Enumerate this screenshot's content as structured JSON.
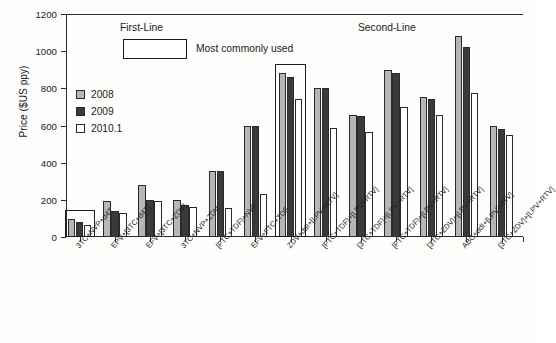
{
  "chart_data": {
    "type": "bar",
    "title": "",
    "xlabel": "",
    "ylabel": "Price ($US ppy)",
    "ylim": [
      0,
      1200
    ],
    "yticks": [
      0,
      200,
      400,
      600,
      800,
      1000,
      1200
    ],
    "grid": false,
    "legend_position": "upper-left-inside",
    "categories": [
      "3TC+NVP+d4T",
      "EPV+[3TC+d4T]",
      "EFV+[3TC+ZDV]",
      "3TC+NVP+ZDV",
      "[FTC+TDF]+NVP",
      "EFV+FTC+TDF",
      "ZDV+ddI+[LPV+RTV]",
      "[FTC+TDF]+[LPV+RTV]",
      "[3TC+TDF]+[LPV+RTV]",
      "[FTC+TDF]+[LPV+RTV]",
      "[3TC+ZDV]+[LPV+RTV]",
      "ABC+ddI+[LPV+RTV]",
      "[3TC+ZDV]+[LPV+RTV]"
    ],
    "series": [
      {
        "name": "2008",
        "color": "#b6b6b6",
        "values": [
          95,
          195,
          280,
          200,
          355,
          600,
          880,
          800,
          655,
          900,
          755,
          1080,
          600
        ]
      },
      {
        "name": "2009",
        "color": "#3a3a3a",
        "values": [
          80,
          140,
          200,
          170,
          355,
          600,
          860,
          800,
          650,
          880,
          740,
          1025,
          580
        ]
      },
      {
        "name": "2010.1",
        "color": "#ffffff",
        "values": [
          65,
          130,
          195,
          160,
          155,
          230,
          740,
          585,
          565,
          700,
          655,
          775,
          550
        ]
      }
    ],
    "annotations": [
      {
        "text": "First-Line",
        "name": "first-line-section-label"
      },
      {
        "text": "Second-Line",
        "name": "second-line-section-label"
      },
      {
        "text": "Most commonly used",
        "name": "most-commonly-used-legend-text"
      }
    ],
    "highlighted_groups": [
      0,
      6
    ],
    "highlight_note": "Most commonly used"
  },
  "axes": {
    "y_label": "Price ($US ppy)",
    "y_ticks": [
      "0",
      "200",
      "400",
      "600",
      "800",
      "1000",
      "1200"
    ]
  },
  "legend": {
    "items": [
      {
        "label": "2008",
        "color": "#b6b6b6"
      },
      {
        "label": "2009",
        "color": "#3a3a3a"
      },
      {
        "label": "2010.1",
        "color": "#ffffff"
      }
    ]
  },
  "sections": {
    "first_line": "First-Line",
    "second_line": "Second-Line",
    "most_commonly_used": "Most commonly used"
  }
}
